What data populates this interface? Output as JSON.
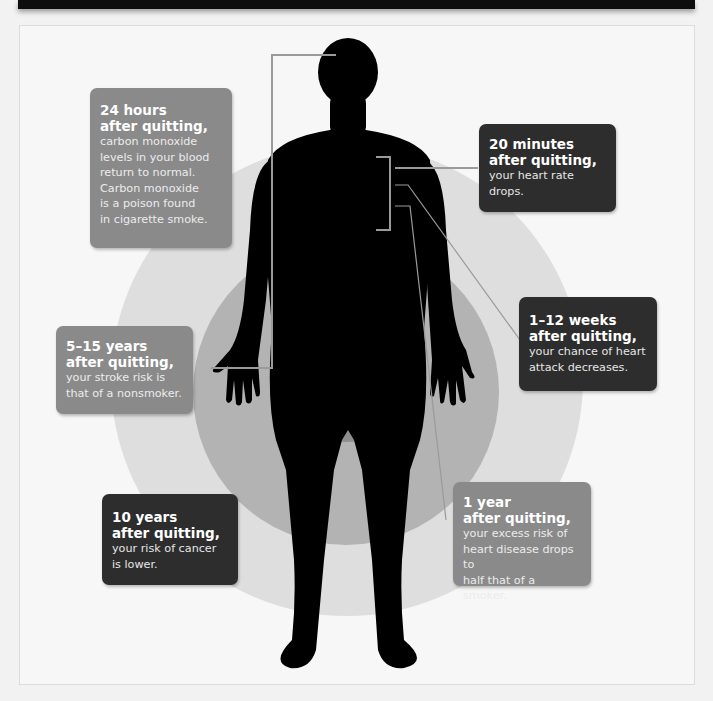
{
  "diagram": {
    "colors": {
      "background": "#f7f7f7",
      "outer_ring": "#dedede",
      "middle_ring": "#b3b3b3",
      "inner_ring": "#8f8f8f",
      "silhouette": "#000000",
      "card_mid": "#8a8a8a",
      "card_dark": "#2d2d2d",
      "leader_line": "#9a9a9a"
    },
    "callouts": [
      {
        "id": "24-hours",
        "title_line1": "24 hours",
        "title_line2": "after quitting,",
        "body": "carbon monoxide levels in your blood return to normal. Carbon monoxide is a poison found in cigarette smoke.",
        "body_lines": [
          "carbon monoxide",
          "levels in your blood",
          "return to normal.",
          "Carbon monoxide",
          "is a poison found",
          "in cigarette smoke."
        ],
        "style": "mid",
        "points_to": "head"
      },
      {
        "id": "20-minutes",
        "title_line1": "20 minutes",
        "title_line2": "after quitting,",
        "body_lines": [
          "your heart rate",
          "drops."
        ],
        "style": "dark",
        "points_to": "chest"
      },
      {
        "id": "1-12-weeks",
        "title_line1": "1–12 weeks",
        "title_line2": "after quitting,",
        "body_lines": [
          "your chance of heart",
          "attack decreases."
        ],
        "style": "dark",
        "points_to": "chest"
      },
      {
        "id": "5-15-years",
        "title_line1": "5–15 years",
        "title_line2": "after quitting,",
        "body_lines": [
          "your stroke risk is",
          "that of a nonsmoker."
        ],
        "style": "mid",
        "points_to": "head"
      },
      {
        "id": "10-years",
        "title_line1": "10 years",
        "title_line2": "after quitting,",
        "body_lines": [
          "your risk of cancer",
          "is lower."
        ],
        "style": "dark",
        "points_to": "none"
      },
      {
        "id": "1-year",
        "title_line1": "1 year",
        "title_line2": "after quitting,",
        "body_lines": [
          "your excess risk of",
          "heart disease drops to",
          "half that of a smoker."
        ],
        "style": "mid",
        "points_to": "chest"
      }
    ]
  }
}
